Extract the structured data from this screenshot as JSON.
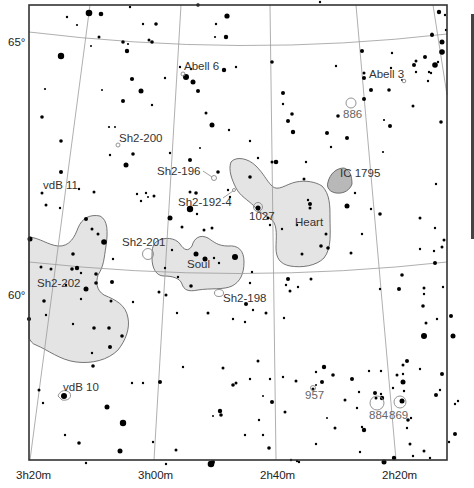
{
  "map": {
    "type": "star-chart",
    "frame": {
      "x": 29,
      "y": 5,
      "width": 418,
      "height": 455
    },
    "colors": {
      "nebula_fill": "#e4e4e4",
      "nebula_dark_fill": "#b8b8b8",
      "grid": "#9a9a9a",
      "frame": "#333333",
      "star": "#000000",
      "text": "#333333"
    },
    "declination_labels": [
      {
        "text": "65°",
        "x": 8,
        "y": 46
      },
      {
        "text": "60°",
        "x": 8,
        "y": 299
      }
    ],
    "ra_labels": [
      {
        "text": "3h20m",
        "x": 16,
        "y": 479
      },
      {
        "text": "3h00m",
        "x": 138,
        "y": 479
      },
      {
        "text": "2h40m",
        "x": 260,
        "y": 479
      },
      {
        "text": "2h20m",
        "x": 382,
        "y": 479
      }
    ],
    "objects": [
      {
        "name": "Abell 6",
        "x": 184,
        "y": 70,
        "type": "planetary-nebula"
      },
      {
        "name": "Abell 3",
        "x": 369,
        "y": 78,
        "type": "planetary-nebula"
      },
      {
        "name": "886",
        "x": 343,
        "y": 118,
        "type": "open-cluster"
      },
      {
        "name": "Sh2-200",
        "x": 119,
        "y": 142,
        "type": "nebula"
      },
      {
        "name": "Sh2-196",
        "x": 157,
        "y": 175,
        "type": "nebula"
      },
      {
        "name": "IC 1795",
        "x": 340,
        "y": 177,
        "type": "nebula"
      },
      {
        "name": "vdB 11",
        "x": 43,
        "y": 189,
        "type": "reflection-nebula"
      },
      {
        "name": "Sh2-192-4",
        "x": 178,
        "y": 206,
        "type": "nebula"
      },
      {
        "name": "Heart",
        "x": 295,
        "y": 226,
        "type": "nebula"
      },
      {
        "name": "1027",
        "x": 249,
        "y": 220,
        "type": "open-cluster"
      },
      {
        "name": "Sh2-201",
        "x": 122,
        "y": 246,
        "type": "nebula"
      },
      {
        "name": "Soul",
        "x": 187,
        "y": 268,
        "type": "nebula"
      },
      {
        "name": "Sh2-202",
        "x": 37,
        "y": 287,
        "type": "nebula"
      },
      {
        "name": "Sh2-198",
        "x": 223,
        "y": 302,
        "type": "nebula"
      },
      {
        "name": "vdB 10",
        "x": 63,
        "y": 391,
        "type": "reflection-nebula"
      },
      {
        "name": "957",
        "x": 305,
        "y": 399,
        "type": "open-cluster"
      },
      {
        "name": "884",
        "x": 369,
        "y": 419,
        "type": "open-cluster"
      },
      {
        "name": "869",
        "x": 389,
        "y": 419,
        "type": "open-cluster"
      }
    ]
  }
}
